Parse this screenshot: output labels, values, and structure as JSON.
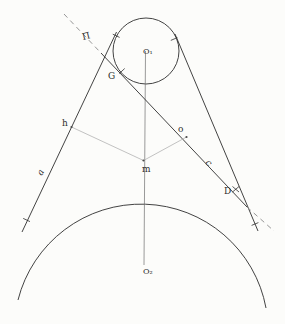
{
  "diagram": {
    "labels": {
      "pi": "Π",
      "g": "G",
      "o1": "O₁",
      "h": "h",
      "o": "o",
      "a": "a",
      "c": "c",
      "m": "m",
      "d": "D",
      "o2": "O₂"
    },
    "colors": {
      "main_line": "#2e2e2e",
      "light_line": "#b3b3b3",
      "axis_line": "#6e6e6e",
      "background": "#fcfcfa"
    }
  }
}
